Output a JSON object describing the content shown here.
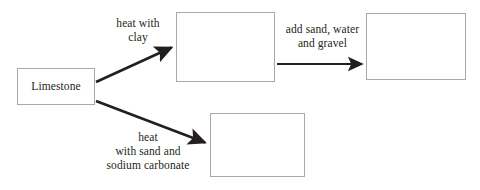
{
  "diagram": {
    "type": "process-flow",
    "background_color": "#ffffff",
    "box_border_color": "#a7a9ac",
    "arrow_color": "#231f20",
    "text_color": "#231f20",
    "nodes": [
      {
        "id": "limestone",
        "label": "Limestone",
        "empty": false
      },
      {
        "id": "cement",
        "label": "",
        "empty": true
      },
      {
        "id": "concrete",
        "label": "",
        "empty": true
      },
      {
        "id": "glass",
        "label": "",
        "empty": true
      }
    ],
    "edges": [
      {
        "id": "limestone-to-cement",
        "from": "limestone",
        "to": "cement",
        "label": "heat with\nclay",
        "direction": "up-right"
      },
      {
        "id": "cement-to-concrete",
        "from": "cement",
        "to": "concrete",
        "label": "add sand, water\nand gravel",
        "direction": "right"
      },
      {
        "id": "limestone-to-glass",
        "from": "limestone",
        "to": "glass",
        "label": "heat\nwith sand and\nsodium carbonate",
        "direction": "down-right"
      }
    ]
  }
}
